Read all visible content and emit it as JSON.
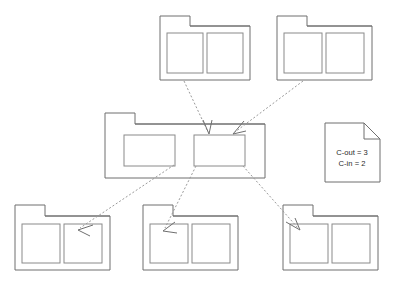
{
  "diagram": {
    "type": "package-dependency-diagram",
    "canvas": {
      "width": 397,
      "height": 286,
      "background": "#ffffff"
    },
    "style": {
      "outline_color": "#6f6f6f",
      "inner_outline_color": "#8a8a8a",
      "arrow_color": "#9a9a9a",
      "fill_color": "#ffffff",
      "text_color": "#2b2b2b",
      "stroke_width": 1,
      "arrow_dash": "2 2"
    },
    "nodes": [
      {
        "id": "pkg-top-left",
        "name": "folder-top-left",
        "shape": "folder",
        "x": 160,
        "y": 16,
        "width": 90,
        "height": 64,
        "tab": {
          "width": 30,
          "height": 10
        },
        "compartments": 2
      },
      {
        "id": "pkg-top-right",
        "name": "folder-top-right",
        "shape": "folder",
        "x": 277,
        "y": 16,
        "width": 95,
        "height": 64,
        "tab": {
          "width": 30,
          "height": 10
        },
        "compartments": 2
      },
      {
        "id": "pkg-center",
        "name": "folder-center",
        "shape": "folder",
        "x": 105,
        "y": 113,
        "width": 160,
        "height": 65,
        "tab": {
          "width": 30,
          "height": 11
        },
        "compartments": 2
      },
      {
        "id": "pkg-bottom-left",
        "name": "folder-bottom-left",
        "shape": "folder",
        "x": 15,
        "y": 205,
        "width": 95,
        "height": 65,
        "tab": {
          "width": 30,
          "height": 11
        },
        "compartments": 2
      },
      {
        "id": "pkg-bottom-middle",
        "name": "folder-bottom-middle",
        "shape": "folder",
        "x": 143,
        "y": 205,
        "width": 95,
        "height": 65,
        "tab": {
          "width": 30,
          "height": 11
        },
        "compartments": 2
      },
      {
        "id": "pkg-bottom-right",
        "name": "folder-bottom-right",
        "shape": "folder",
        "x": 283,
        "y": 205,
        "width": 95,
        "height": 65,
        "tab": {
          "width": 30,
          "height": 11
        },
        "compartments": 2
      }
    ],
    "edges": [
      {
        "id": "edge-top-left-to-center",
        "from": "pkg-top-left",
        "to": "pkg-center",
        "direction": "incoming"
      },
      {
        "id": "edge-top-right-to-center",
        "from": "pkg-top-right",
        "to": "pkg-center",
        "direction": "incoming"
      },
      {
        "id": "edge-center-to-bottom-left",
        "from": "pkg-center",
        "to": "pkg-bottom-left",
        "direction": "outgoing"
      },
      {
        "id": "edge-center-to-bottom-mid",
        "from": "pkg-center",
        "to": "pkg-bottom-middle",
        "direction": "outgoing"
      },
      {
        "id": "edge-center-to-bottom-right",
        "from": "pkg-center",
        "to": "pkg-bottom-right",
        "direction": "outgoing"
      }
    ],
    "note": {
      "id": "metrics-note",
      "name": "metrics-note",
      "x": 325,
      "y": 123,
      "width": 55,
      "height": 59,
      "fold": 16,
      "lines": [
        {
          "label": "C-out = 3"
        },
        {
          "label": "C-in = 2"
        }
      ]
    }
  }
}
